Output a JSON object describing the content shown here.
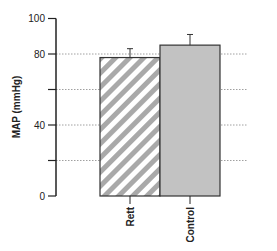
{
  "chart_data": {
    "type": "bar",
    "title": "",
    "xlabel": "",
    "ylabel": "MAP (mmHg)",
    "ylim": [
      0,
      100
    ],
    "yticks": [
      0,
      20,
      40,
      60,
      80,
      100
    ],
    "ytick_labels": [
      "0",
      "",
      "40",
      "",
      "80",
      "100"
    ],
    "grid": "horizontal dotted at 20, 40, 60, 80",
    "categories": [
      "Rett",
      "Control"
    ],
    "values": [
      78,
      85
    ],
    "errors": [
      5,
      6
    ],
    "styles": [
      {
        "name": "Rett",
        "fill": "hatched diagonal",
        "colors": [
          "#ffffff",
          "#a9a9a9"
        ]
      },
      {
        "name": "Control",
        "fill": "solid",
        "colors": [
          "#c2c2c2"
        ]
      }
    ]
  },
  "colors": {
    "axis": "#222222",
    "grid": "#888888",
    "hatch": "#a9a9a9",
    "control_fill": "#c2c2c2",
    "bar_edge": "#333333"
  }
}
